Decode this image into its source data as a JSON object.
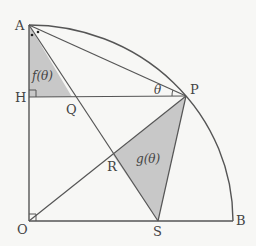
{
  "diagram": {
    "type": "geometry",
    "colors": {
      "line": "#555555",
      "fill": "#c8c8c8",
      "background": "#f7f7f5"
    },
    "points": {
      "O": {
        "label": "O",
        "x": 29,
        "y": 221
      },
      "A": {
        "label": "A",
        "x": 29,
        "y": 25
      },
      "B": {
        "label": "B",
        "x": 233,
        "y": 221
      },
      "H": {
        "label": "H",
        "x": 29,
        "y": 97
      },
      "P": {
        "label": "P",
        "x": 186,
        "y": 96
      },
      "Q": {
        "label": "Q",
        "x": 72,
        "y": 97
      },
      "R": {
        "label": "R",
        "x": 113,
        "y": 155
      },
      "S": {
        "label": "S",
        "x": 158,
        "y": 221
      }
    },
    "regions": {
      "f": {
        "label": "f(θ)",
        "vertices": [
          "A",
          "H",
          "Q"
        ]
      },
      "g": {
        "label": "g(θ)",
        "vertices": [
          "R",
          "P",
          "S"
        ]
      }
    },
    "angle_label": "θ"
  }
}
